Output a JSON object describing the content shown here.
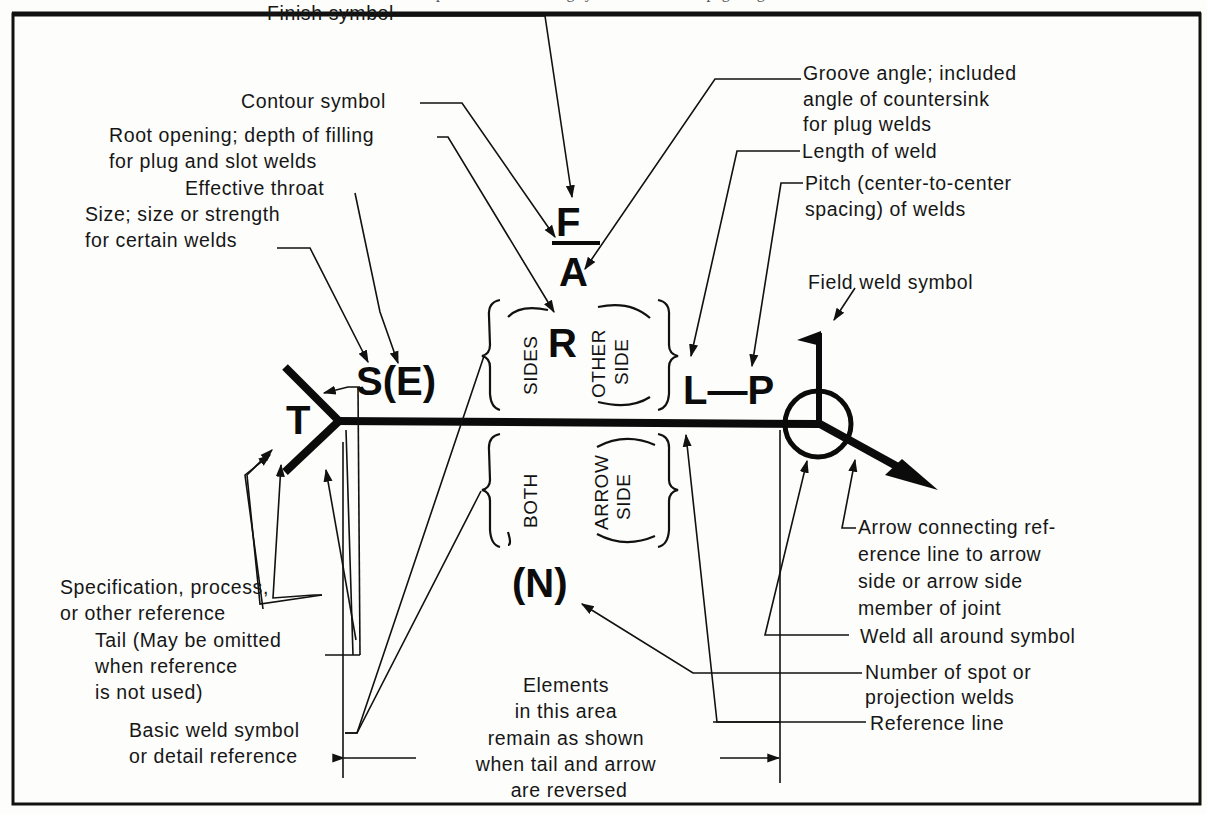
{
  "header_fragment": "... placement of welding symbol elements ... page ... g ...",
  "symbols": {
    "tail_T": "T",
    "size_S": "S(E)",
    "root_R": "R",
    "finish_F": "F",
    "angle_A": "A",
    "length_pitch": "L—P",
    "number_N": "(N)"
  },
  "rotated": {
    "sides": "SIDES",
    "other_side_1": "OTHER",
    "other_side_2": "SIDE",
    "both": "BOTH",
    "arrow_side_1": "ARROW",
    "arrow_side_2": "SIDE"
  },
  "labels": {
    "finish_symbol": "Finish symbol",
    "contour_symbol": "Contour symbol",
    "root_opening_1": "Root opening; depth of filling",
    "root_opening_2": "for plug and slot welds",
    "effective_throat": "Effective throat",
    "size_1": "Size; size or strength",
    "size_2": "for certain welds",
    "groove_angle_1": "Groove angle; included",
    "groove_angle_2": "angle of countersink",
    "groove_angle_3": "for plug welds",
    "length_of_weld": "Length of weld",
    "pitch_1": "Pitch (center-to-center",
    "pitch_2": "spacing) of welds",
    "field_weld": "Field weld symbol",
    "arrow_connecting_1": "Arrow connecting ref-",
    "arrow_connecting_2": "erence line to arrow",
    "arrow_connecting_3": "side or arrow side",
    "arrow_connecting_4": "member of joint",
    "weld_all_around": "Weld all around symbol",
    "number_spot_1": "Number of spot or",
    "number_spot_2": "projection welds",
    "reference_line": "Reference line",
    "specification_1": "Specification, process,",
    "specification_2": "or other reference",
    "tail_1": "Tail (May be omitted",
    "tail_2": "when reference",
    "tail_3": "is not used)",
    "basic_weld_1": "Basic weld symbol",
    "basic_weld_2": "or detail reference",
    "elements_1": "Elements",
    "elements_2": "in this area",
    "elements_3": "remain as shown",
    "elements_4": "when tail and arrow",
    "elements_5": "are reversed"
  },
  "colors": {
    "ink": "#111111",
    "paper": "#fdfdfb"
  }
}
